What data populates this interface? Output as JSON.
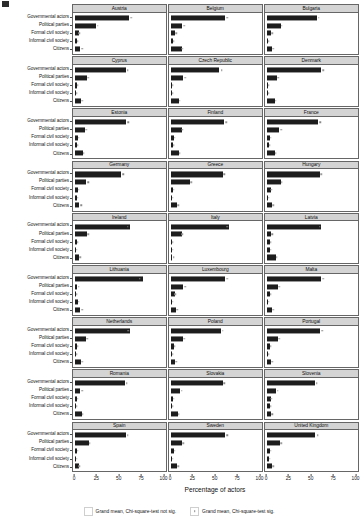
{
  "figure": {
    "x_title": "Percentage of actors",
    "y_categories": [
      "Governmental actors",
      "Political parties",
      "Formal civil society",
      "Informal civil society",
      "Citizens"
    ],
    "x_ticks": [
      "0",
      "25",
      "50",
      "75",
      "100"
    ]
  },
  "legend": {
    "items": [
      {
        "label": "Grand mean, Chi-square-test not sig.",
        "significant": false
      },
      {
        "label": "Grand mean, Chi-square-test sig.",
        "significant": true
      }
    ]
  },
  "chart_data": {
    "type": "bar",
    "title": "",
    "xlabel": "Percentage of actors",
    "ylabel": "",
    "xlim": [
      0,
      100
    ],
    "grid": false,
    "legend_position": "bottom",
    "orientation": "horizontal",
    "facet_layout": {
      "rows": 9,
      "cols": 3
    },
    "categories": [
      "Governmental actors",
      "Political parties",
      "Formal civil society",
      "Informal civil society",
      "Citizens"
    ],
    "panels": [
      {
        "name": "Austria",
        "values": [
          62,
          24,
          4,
          2,
          6
        ],
        "grand_mean": [
          64,
          26,
          5,
          3,
          8
        ],
        "sig": [
          false,
          false,
          false,
          false,
          true
        ]
      },
      {
        "name": "Belgium",
        "values": [
          62,
          13,
          5,
          2,
          12
        ],
        "grand_mean": [
          64,
          15,
          6,
          3,
          13
        ],
        "sig": [
          true,
          false,
          false,
          false,
          false
        ]
      },
      {
        "name": "Bulgaria",
        "values": [
          57,
          16,
          5,
          1,
          6
        ],
        "grand_mean": [
          59,
          17,
          6,
          2,
          7
        ],
        "sig": [
          false,
          false,
          false,
          false,
          false
        ]
      },
      {
        "name": "Cyprus",
        "values": [
          58,
          14,
          2,
          1,
          7
        ],
        "grand_mean": [
          60,
          15,
          3,
          2,
          8
        ],
        "sig": [
          true,
          false,
          false,
          false,
          false
        ]
      },
      {
        "name": "Czech Republic",
        "values": [
          55,
          14,
          1,
          1,
          9
        ],
        "grand_mean": [
          58,
          16,
          2,
          2,
          10
        ],
        "sig": [
          true,
          false,
          false,
          false,
          false
        ]
      },
      {
        "name": "Denmark",
        "values": [
          62,
          11,
          1,
          1,
          9
        ],
        "grand_mean": [
          64,
          13,
          2,
          2,
          10
        ],
        "sig": [
          false,
          true,
          false,
          false,
          false
        ]
      },
      {
        "name": "Estonia",
        "values": [
          58,
          11,
          3,
          2,
          9
        ],
        "grand_mean": [
          61,
          13,
          4,
          3,
          10
        ],
        "sig": [
          true,
          false,
          false,
          false,
          false
        ]
      },
      {
        "name": "Finland",
        "values": [
          61,
          12,
          3,
          2,
          9
        ],
        "grand_mean": [
          63,
          13,
          4,
          3,
          10
        ],
        "sig": [
          false,
          true,
          false,
          false,
          false
        ]
      },
      {
        "name": "France",
        "values": [
          58,
          14,
          3,
          2,
          9
        ],
        "grand_mean": [
          61,
          16,
          4,
          3,
          10
        ],
        "sig": [
          true,
          true,
          false,
          false,
          false
        ]
      },
      {
        "name": "Germany",
        "values": [
          52,
          13,
          3,
          2,
          5
        ],
        "grand_mean": [
          55,
          15,
          4,
          3,
          7
        ],
        "sig": [
          true,
          true,
          false,
          false,
          true
        ]
      },
      {
        "name": "Greece",
        "values": [
          59,
          22,
          2,
          1,
          7
        ],
        "grand_mean": [
          61,
          23,
          3,
          2,
          8
        ],
        "sig": [
          true,
          false,
          false,
          false,
          false
        ]
      },
      {
        "name": "Hungary",
        "values": [
          60,
          16,
          4,
          1,
          6
        ],
        "grand_mean": [
          62,
          17,
          5,
          2,
          7
        ],
        "sig": [
          false,
          false,
          false,
          false,
          false
        ]
      },
      {
        "name": "Ireland",
        "values": [
          63,
          14,
          2,
          1,
          5
        ],
        "grand_mean": [
          60,
          15,
          3,
          2,
          6
        ],
        "sig": [
          true,
          false,
          false,
          false,
          false
        ]
      },
      {
        "name": "Italy",
        "values": [
          66,
          12,
          1,
          1,
          1
        ],
        "grand_mean": [
          64,
          13,
          2,
          2,
          3
        ],
        "sig": [
          true,
          false,
          false,
          false,
          true
        ]
      },
      {
        "name": "Latvia",
        "values": [
          62,
          4,
          3,
          3,
          10
        ],
        "grand_mean": [
          60,
          6,
          4,
          4,
          11
        ],
        "sig": [
          true,
          true,
          false,
          false,
          false
        ]
      },
      {
        "name": "Lithuania",
        "values": [
          78,
          2,
          1,
          3,
          6
        ],
        "grand_mean": [
          74,
          4,
          2,
          4,
          8
        ],
        "sig": [
          false,
          true,
          false,
          false,
          true
        ]
      },
      {
        "name": "Luxembourg",
        "values": [
          62,
          14,
          4,
          1,
          6
        ],
        "grand_mean": [
          64,
          16,
          5,
          2,
          7
        ],
        "sig": [
          false,
          true,
          false,
          false,
          true
        ]
      },
      {
        "name": "Malta",
        "values": [
          62,
          13,
          3,
          1,
          6
        ],
        "grand_mean": [
          64,
          14,
          4,
          2,
          7
        ],
        "sig": [
          false,
          false,
          false,
          false,
          false
        ]
      },
      {
        "name": "Netherlands",
        "values": [
          63,
          12,
          2,
          1,
          7
        ],
        "grand_mean": [
          61,
          14,
          3,
          2,
          8
        ],
        "sig": [
          true,
          true,
          false,
          false,
          false
        ]
      },
      {
        "name": "Poland",
        "values": [
          57,
          14,
          3,
          1,
          4
        ],
        "grand_mean": [
          59,
          15,
          4,
          2,
          6
        ],
        "sig": [
          false,
          false,
          false,
          false,
          true
        ]
      },
      {
        "name": "Portugal",
        "values": [
          61,
          13,
          3,
          1,
          5
        ],
        "grand_mean": [
          63,
          14,
          4,
          2,
          6
        ],
        "sig": [
          true,
          false,
          false,
          false,
          true
        ]
      },
      {
        "name": "Romania",
        "values": [
          57,
          6,
          2,
          1,
          8
        ],
        "grand_mean": [
          59,
          8,
          3,
          2,
          9
        ],
        "sig": [
          true,
          true,
          false,
          false,
          false
        ]
      },
      {
        "name": "Slovakia",
        "values": [
          59,
          10,
          2,
          1,
          8
        ],
        "grand_mean": [
          61,
          12,
          3,
          2,
          9
        ],
        "sig": [
          true,
          true,
          false,
          false,
          false
        ]
      },
      {
        "name": "Slovenia",
        "values": [
          55,
          10,
          4,
          3,
          4
        ],
        "grand_mean": [
          57,
          12,
          5,
          4,
          6
        ],
        "sig": [
          true,
          true,
          false,
          false,
          true
        ]
      },
      {
        "name": "Spain",
        "values": [
          58,
          16,
          2,
          1,
          4
        ],
        "grand_mean": [
          60,
          17,
          3,
          2,
          5
        ],
        "sig": [
          false,
          false,
          false,
          false,
          false
        ]
      },
      {
        "name": "Sweden",
        "values": [
          62,
          13,
          3,
          1,
          7
        ],
        "grand_mean": [
          64,
          14,
          4,
          2,
          8
        ],
        "sig": [
          true,
          false,
          false,
          false,
          false
        ]
      },
      {
        "name": "United Kingdom",
        "values": [
          55,
          15,
          3,
          2,
          6
        ],
        "grand_mean": [
          58,
          16,
          4,
          3,
          7
        ],
        "sig": [
          true,
          false,
          false,
          false,
          false
        ]
      }
    ]
  }
}
